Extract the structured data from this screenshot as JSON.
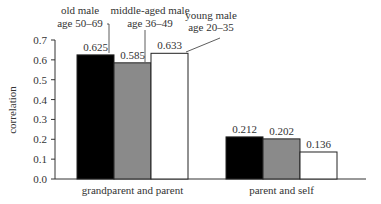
{
  "chart_data": {
    "type": "bar",
    "title": "",
    "xlabel": "",
    "ylabel": "correlation",
    "ylim": [
      0.0,
      0.7
    ],
    "yticks": [
      "0.0",
      "0.1",
      "0.2",
      "0.3",
      "0.4",
      "0.5",
      "0.6",
      "0.7"
    ],
    "grid": false,
    "legend_position": "callout labels above first group",
    "categories": [
      "grandparent and parent",
      "parent and self"
    ],
    "series": [
      {
        "name": "old male age 50–69",
        "label_line1": "old male",
        "label_line2": "age 50–69",
        "color": "#000000",
        "values": [
          0.625,
          0.212
        ],
        "value_labels": [
          "0.625",
          "0.212"
        ]
      },
      {
        "name": "middle-aged male age 36–49",
        "label_line1": "middle-aged male",
        "label_line2": "age 36–49",
        "color": "#808080",
        "values": [
          0.585,
          0.202
        ],
        "value_labels": [
          "0.585",
          "0.202"
        ]
      },
      {
        "name": "young male age 20–35",
        "label_line1": "young male",
        "label_line2": "age 20–35",
        "color": "#ffffff",
        "values": [
          0.633,
          0.136
        ],
        "value_labels": [
          "0.633",
          "0.136"
        ]
      }
    ]
  }
}
